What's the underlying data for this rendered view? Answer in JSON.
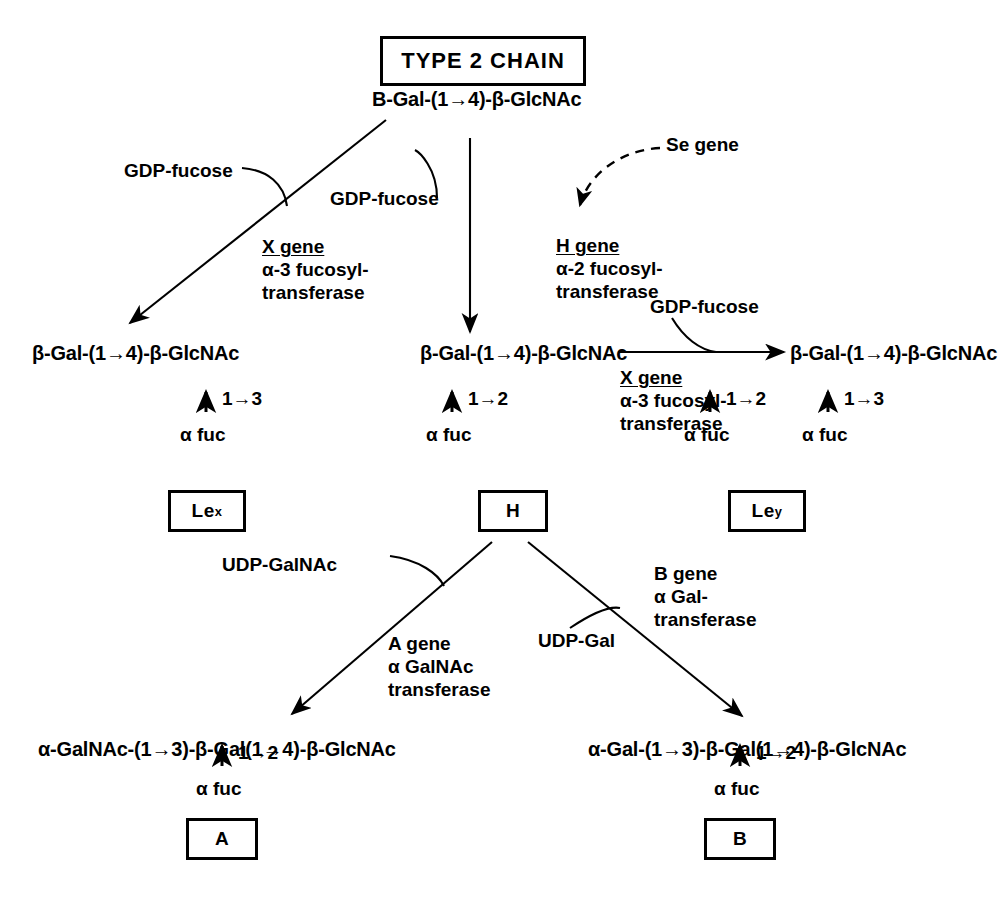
{
  "diagram": {
    "title": "TYPE 2 CHAIN",
    "type": "biosynthesis-pathway",
    "nodes": {
      "type2_chain": {
        "box_label": "TYPE 2 CHAIN",
        "formula": "B-Gal-(1→4)-β-GlcNAc"
      },
      "lewis_x_product": {
        "formula": "β-Gal-(1→4)-β-GlcNAc",
        "linkage": "1→3",
        "sugar": "α fuc",
        "box_label": "Le",
        "box_superscript": "x"
      },
      "h_product": {
        "formula": "β-Gal-(1→4)-β-GlcNAc",
        "linkage": "1→2",
        "sugar": "α fuc",
        "box_label": "H"
      },
      "lewis_y_product": {
        "formula": "β-Gal-(1→4)-β-GlcNAc",
        "linkage_1": "1→2",
        "sugar_1": "α fuc",
        "linkage_2": "1→3",
        "sugar_2": "α fuc",
        "box_label": "Le",
        "box_superscript": "y"
      },
      "a_antigen": {
        "formula": "α-GalNAc-(1→3)-β-Gal(1→4)-β-GlcNAc",
        "linkage": "1→2",
        "sugar": "α fuc",
        "box_label": "A"
      },
      "b_antigen": {
        "formula": "α-Gal-(1→3)-β-Gal(1→4)-β-GlcNAc",
        "linkage": "1→2",
        "sugar": "α fuc",
        "box_label": "B"
      }
    },
    "reactions": [
      {
        "id": "x-gene-left",
        "donor": "GDP-fucose",
        "gene": "X gene",
        "gene_underlined_letter": "X",
        "enzyme_line1": "α-3 fucosyl-",
        "enzyme_line2": "transferase"
      },
      {
        "id": "h-gene-center",
        "donor": "GDP-fucose",
        "gene": "H gene",
        "gene_underlined_letter": "H",
        "enzyme_line1": "α-2 fucosyl-",
        "enzyme_line2": "transferase",
        "regulator": "Se gene"
      },
      {
        "id": "x-gene-right",
        "donor": "GDP-fucose",
        "gene": "X gene",
        "gene_underlined_letter": "X",
        "enzyme_line1": "α-3 fucosyl-",
        "enzyme_line2": "transferase"
      },
      {
        "id": "a-gene",
        "donor": "UDP-GalNAc",
        "gene": "A gene",
        "enzyme_line1": "α GalNAc",
        "enzyme_line2": "transferase"
      },
      {
        "id": "b-gene",
        "donor": "UDP-Gal",
        "gene": "B gene",
        "enzyme_line1": "α Gal-",
        "enzyme_line2": "transferase"
      }
    ],
    "colors": {
      "ink": "#000000",
      "background": "#ffffff"
    }
  }
}
